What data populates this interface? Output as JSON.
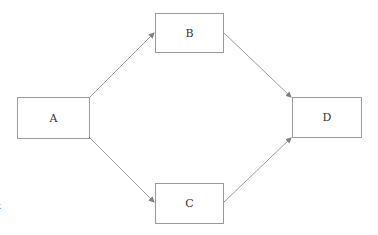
{
  "diagram": {
    "type": "flowchart",
    "nodes": [
      {
        "id": "A",
        "label": "A",
        "x": 17,
        "y": 97,
        "w": 72,
        "h": 41
      },
      {
        "id": "B",
        "label": "B",
        "x": 155,
        "y": 13,
        "w": 68,
        "h": 39
      },
      {
        "id": "C",
        "label": "C",
        "x": 155,
        "y": 183,
        "w": 68,
        "h": 40
      },
      {
        "id": "D",
        "label": "D",
        "x": 292,
        "y": 97,
        "w": 69,
        "h": 40
      }
    ],
    "edges": [
      {
        "from": "A",
        "to": "B"
      },
      {
        "from": "A",
        "to": "C"
      },
      {
        "from": "B",
        "to": "D"
      },
      {
        "from": "C",
        "to": "D"
      }
    ],
    "colors": {
      "stroke": "#9a9a9a",
      "arrow": "#808080",
      "text": "#333333"
    }
  },
  "stray_glyph": "x"
}
